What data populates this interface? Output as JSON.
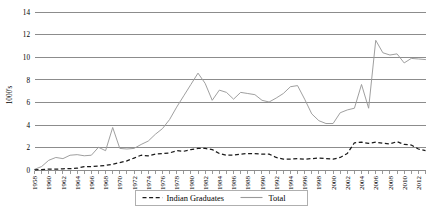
{
  "chart_data": {
    "type": "line",
    "title": "",
    "xlabel": "",
    "ylabel": "1000's",
    "ylim": [
      0,
      14
    ],
    "xlim": [
      1958,
      2013
    ],
    "ytick_values": [
      0,
      2,
      4,
      6,
      8,
      10,
      12,
      14
    ],
    "ytick_labels": [
      "0",
      "2",
      "4",
      "6",
      "8",
      "10",
      "12",
      "14"
    ],
    "grid": true,
    "legend_position": "bottom-center",
    "x_tick_step": 1,
    "x_label_step": 2,
    "xtick_labels": [
      "1958",
      "1960",
      "1962",
      "1964",
      "1966",
      "1968",
      "1970",
      "1972",
      "1974",
      "1976",
      "1978",
      "1980",
      "1982",
      "1984",
      "1986",
      "1988",
      "1990",
      "1992",
      "1994",
      "1996",
      "1998",
      "2000",
      "2002",
      "2004",
      "2006",
      "2008",
      "2010",
      "2012"
    ],
    "x": [
      1958,
      1959,
      1960,
      1961,
      1962,
      1963,
      1964,
      1965,
      1966,
      1967,
      1968,
      1969,
      1970,
      1971,
      1972,
      1973,
      1974,
      1975,
      1976,
      1977,
      1978,
      1979,
      1980,
      1981,
      1982,
      1983,
      1984,
      1985,
      1986,
      1987,
      1988,
      1989,
      1990,
      1991,
      1992,
      1993,
      1994,
      1995,
      1996,
      1997,
      1998,
      1999,
      2000,
      2001,
      2002,
      2003,
      2004,
      2005,
      2006,
      2007,
      2008,
      2009,
      2010,
      2011,
      2012,
      2013
    ],
    "series": [
      {
        "name": "Indian Graduates",
        "style": "dashed",
        "color": "#1a1a1a",
        "values": [
          0.05,
          0.08,
          0.12,
          0.12,
          0.15,
          0.17,
          0.2,
          0.35,
          0.35,
          0.4,
          0.45,
          0.55,
          0.7,
          0.85,
          1.1,
          1.35,
          1.3,
          1.45,
          1.5,
          1.55,
          1.75,
          1.7,
          1.85,
          1.95,
          1.95,
          1.85,
          1.5,
          1.35,
          1.35,
          1.45,
          1.5,
          1.5,
          1.45,
          1.45,
          1.15,
          1.0,
          1.0,
          1.05,
          1.0,
          1.05,
          1.1,
          1.05,
          1.0,
          1.15,
          1.5,
          2.45,
          2.5,
          2.4,
          2.5,
          2.4,
          2.35,
          2.55,
          2.3,
          2.25,
          1.9,
          1.75
        ]
      },
      {
        "name": "Total",
        "style": "solid",
        "color": "#9a9a9a",
        "values": [
          0.1,
          0.35,
          0.9,
          1.15,
          1.05,
          1.35,
          1.4,
          1.3,
          1.35,
          2.05,
          1.75,
          3.8,
          1.95,
          1.9,
          1.95,
          2.3,
          2.6,
          3.2,
          3.7,
          4.5,
          5.6,
          6.6,
          7.6,
          8.6,
          7.7,
          6.2,
          7.1,
          6.9,
          6.3,
          6.9,
          6.8,
          6.7,
          6.2,
          6.05,
          6.4,
          6.8,
          7.4,
          7.5,
          6.3,
          5.0,
          4.4,
          4.15,
          4.15,
          4.5,
          4.75,
          5.25,
          5.35,
          5.45,
          12.0,
          9.7,
          11.0,
          11.9,
          9.9,
          11.8,
          11.9,
          5.6
        ]
      }
    ],
    "series_note_total_tail": [
      5.1,
      5.35,
      5.5,
      7.6,
      5.5,
      11.5,
      10.4,
      10.2,
      10.3,
      9.5,
      9.9,
      9.85,
      9.8
    ]
  },
  "legend": {
    "entries": [
      {
        "label": "Indian Graduates",
        "style": "dashed",
        "color": "#1a1a1a"
      },
      {
        "label": "Total",
        "style": "solid",
        "color": "#9a9a9a"
      }
    ]
  },
  "axis": {
    "y_title": "1000's"
  }
}
